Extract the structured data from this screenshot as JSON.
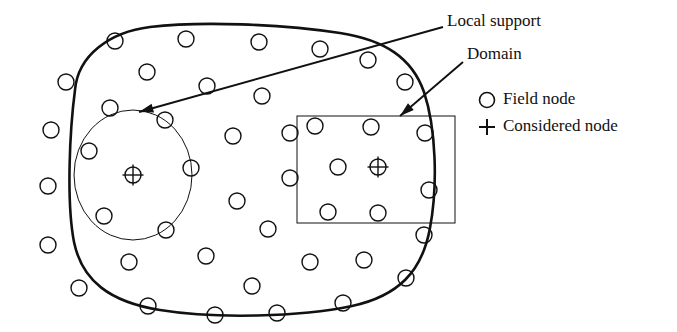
{
  "figure": {
    "title": "",
    "background_color": "#ffffff",
    "stroke_color": "#111111",
    "width": 677,
    "height": 332
  },
  "annotations": [
    {
      "id": "local-support",
      "label": "Local support",
      "text_x": 447,
      "text_y": 22,
      "leader_from": [
        443,
        27
      ],
      "leader_to": [
        139,
        112
      ]
    },
    {
      "id": "domain",
      "label": "Domain",
      "text_x": 467,
      "text_y": 55,
      "leader_from": [
        463,
        62
      ],
      "leader_to": [
        400,
        116
      ]
    }
  ],
  "legend": {
    "position": "right",
    "items": [
      {
        "symbol": "circle-icon",
        "label": "Field node",
        "x": 487,
        "y": 100
      },
      {
        "symbol": "plus-icon",
        "label": "Considered node",
        "x": 487,
        "y": 127
      }
    ],
    "text_x": 503
  },
  "chart_data": {
    "type": "diagram",
    "domain_boundary": {
      "name": "problem-domain-boundary",
      "stroke_width": 2.6,
      "path": "M 75,90 C 78,55 110,32 150,27 C 200,21 280,24 340,33 C 385,40 412,58 424,92 C 436,128 438,185 430,228 C 422,272 398,296 352,306 C 300,317 215,319 160,310 C 110,302 82,281 74,242 C 66,200 70,128 75,90 Z"
    },
    "local_support_circle": {
      "name": "local-support-circle",
      "cx": 133,
      "cy": 175,
      "rx": 59,
      "ry": 65,
      "stroke_width": 1.0
    },
    "local_support_rectangle": {
      "name": "local-support-rectangle",
      "x": 297,
      "y": 116,
      "width": 158,
      "height": 107,
      "stroke_width": 1.0
    },
    "node_radius": 8,
    "considered_nodes": [
      {
        "cx": 133,
        "cy": 175
      },
      {
        "cx": 378,
        "cy": 167
      }
    ],
    "boundary_nodes": [
      {
        "cx": 115,
        "cy": 41
      },
      {
        "cx": 186,
        "cy": 39
      },
      {
        "cx": 259,
        "cy": 42
      },
      {
        "cx": 320,
        "cy": 49
      },
      {
        "cx": 368,
        "cy": 60
      },
      {
        "cx": 405,
        "cy": 82
      },
      {
        "cx": 425,
        "cy": 133
      },
      {
        "cx": 429,
        "cy": 190
      },
      {
        "cx": 424,
        "cy": 235
      },
      {
        "cx": 406,
        "cy": 278
      },
      {
        "cx": 343,
        "cy": 303
      },
      {
        "cx": 277,
        "cy": 313
      },
      {
        "cx": 215,
        "cy": 315
      },
      {
        "cx": 148,
        "cy": 306
      },
      {
        "cx": 79,
        "cy": 288
      },
      {
        "cx": 48,
        "cy": 245
      },
      {
        "cx": 48,
        "cy": 186
      },
      {
        "cx": 51,
        "cy": 130
      },
      {
        "cx": 66,
        "cy": 82
      }
    ],
    "interior_nodes": [
      {
        "cx": 147,
        "cy": 72
      },
      {
        "cx": 207,
        "cy": 86
      },
      {
        "cx": 262,
        "cy": 96
      },
      {
        "cx": 315,
        "cy": 126
      },
      {
        "cx": 371,
        "cy": 127
      },
      {
        "cx": 110,
        "cy": 108
      },
      {
        "cx": 165,
        "cy": 120
      },
      {
        "cx": 233,
        "cy": 136
      },
      {
        "cx": 290,
        "cy": 133
      },
      {
        "cx": 89,
        "cy": 151
      },
      {
        "cx": 191,
        "cy": 168
      },
      {
        "cx": 290,
        "cy": 178
      },
      {
        "cx": 338,
        "cy": 167
      },
      {
        "cx": 104,
        "cy": 216
      },
      {
        "cx": 166,
        "cy": 230
      },
      {
        "cx": 237,
        "cy": 201
      },
      {
        "cx": 268,
        "cy": 229
      },
      {
        "cx": 328,
        "cy": 212
      },
      {
        "cx": 378,
        "cy": 213
      },
      {
        "cx": 129,
        "cy": 262
      },
      {
        "cx": 206,
        "cy": 256
      },
      {
        "cx": 252,
        "cy": 286
      },
      {
        "cx": 310,
        "cy": 262
      },
      {
        "cx": 364,
        "cy": 260
      }
    ]
  }
}
